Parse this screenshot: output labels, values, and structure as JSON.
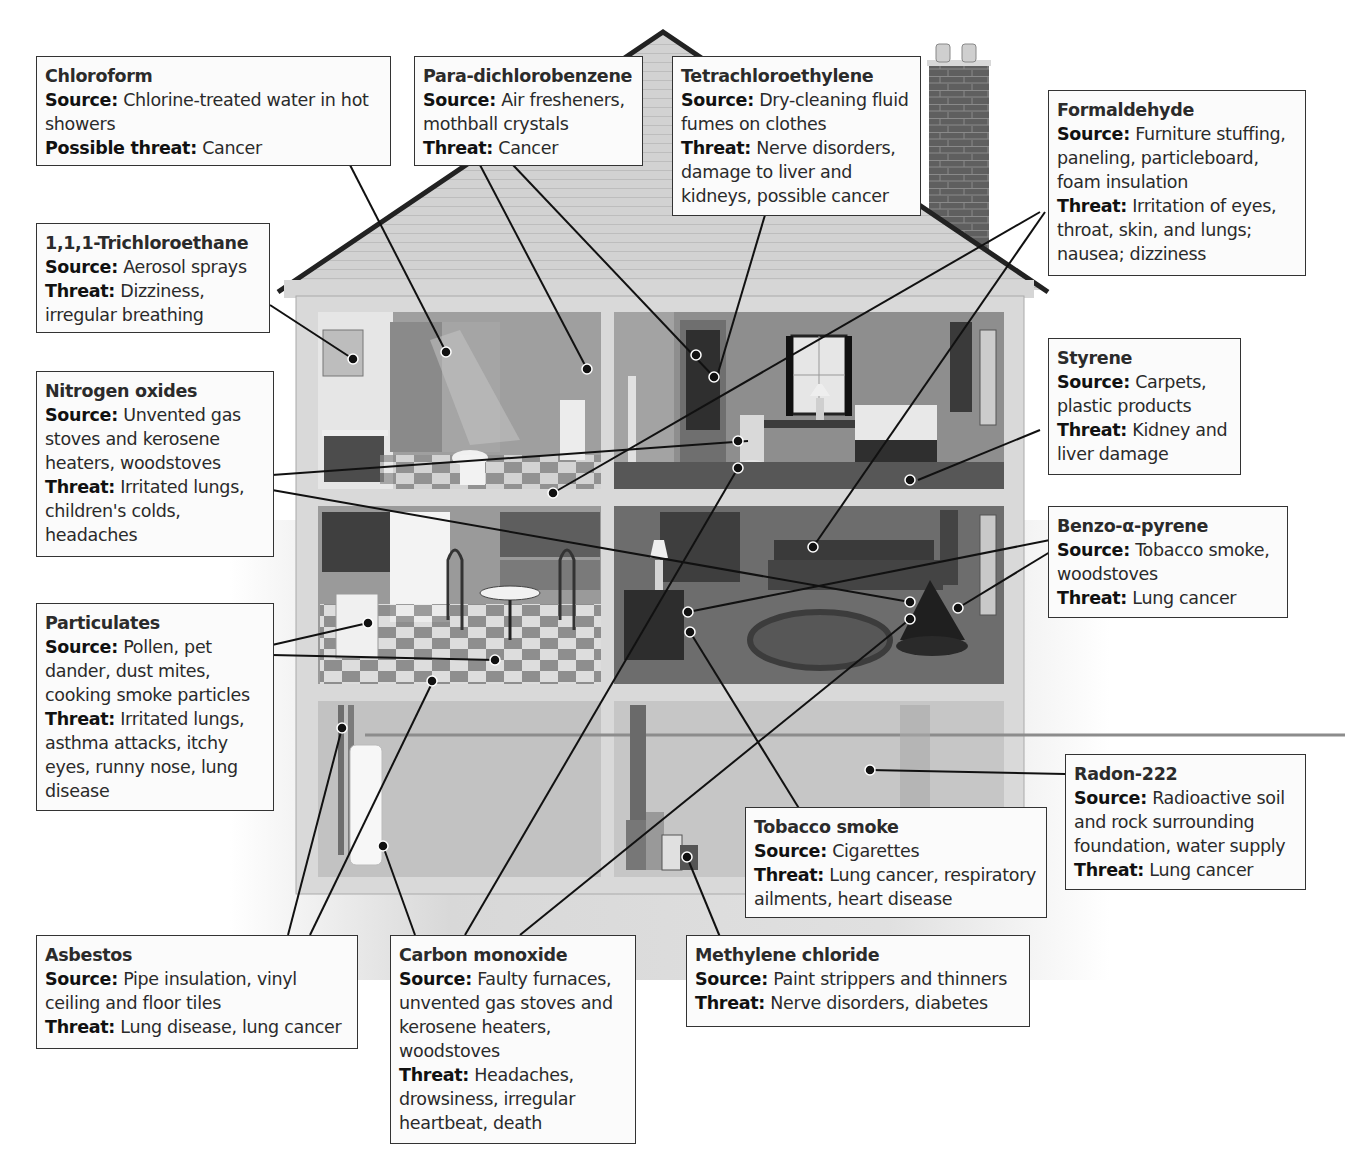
{
  "diagram": {
    "colors": {
      "background": "#ffffff",
      "callout_fill": "#fbfbfb",
      "callout_border": "#333333",
      "leader_line": "#111111",
      "roof": "#cfcfcf",
      "wall": "#d9d9d9",
      "chimney": "#6a6a6a"
    },
    "labels": {
      "source": "Source:",
      "threat": "Threat:",
      "possible_threat": "Possible threat:"
    },
    "pollutants": [
      {
        "id": "chloroform",
        "name": "Chloroform",
        "source_label": "Source:",
        "source": "Chlorine-treated water in hot showers",
        "threat_label": "Possible threat:",
        "threat": "Cancer"
      },
      {
        "id": "para-dichlorobenzene",
        "name": "Para-dichlorobenzene",
        "source_label": "Source:",
        "source": "Air fresheners, mothball crystals",
        "threat_label": "Threat:",
        "threat": "Cancer"
      },
      {
        "id": "tetrachloroethylene",
        "name": "Tetrachloroethylene",
        "source_label": "Source:",
        "source": "Dry-cleaning fluid fumes on clothes",
        "threat_label": "Threat:",
        "threat": "Nerve disorders, damage to liver and kidneys, possible cancer"
      },
      {
        "id": "formaldehyde",
        "name": "Formaldehyde",
        "source_label": "Source:",
        "source": "Furniture stuffing, paneling, particleboard, foam insulation",
        "threat_label": "Threat:",
        "threat": "Irritation of eyes, throat, skin, and lungs; nausea; dizziness"
      },
      {
        "id": "trichloroethane",
        "name": "1,1,1-Trichloroethane",
        "source_label": "Source:",
        "source": "Aerosol sprays",
        "threat_label": "Threat:",
        "threat": "Dizziness, irregular breathing"
      },
      {
        "id": "nitrogen-oxides",
        "name": "Nitrogen oxides",
        "source_label": "Source:",
        "source": "Unvented gas stoves and kerosene heaters, woodstoves",
        "threat_label": "Threat:",
        "threat": "Irritated lungs, children's colds, headaches"
      },
      {
        "id": "styrene",
        "name": "Styrene",
        "source_label": "Source:",
        "source": "Carpets, plastic products",
        "threat_label": "Threat:",
        "threat": "Kidney and liver damage"
      },
      {
        "id": "benzo-a-pyrene",
        "name": "Benzo-α-pyrene",
        "source_label": "Source:",
        "source": "Tobacco smoke, woodstoves",
        "threat_label": "Threat:",
        "threat": "Lung cancer"
      },
      {
        "id": "particulates",
        "name": "Particulates",
        "source_label": "Source:",
        "source": "Pollen, pet dander, dust mites, cooking smoke particles",
        "threat_label": "Threat:",
        "threat": "Irritated lungs, asthma attacks, itchy eyes, runny nose, lung disease"
      },
      {
        "id": "radon-222",
        "name": "Radon-222",
        "source_label": "Source:",
        "source": "Radioactive soil and rock surrounding foundation, water supply",
        "threat_label": "Threat:",
        "threat": "Lung cancer"
      },
      {
        "id": "tobacco-smoke",
        "name": "Tobacco smoke",
        "source_label": "Source:",
        "source": "Cigarettes",
        "threat_label": "Threat:",
        "threat": "Lung cancer, respiratory ailments, heart disease"
      },
      {
        "id": "asbestos",
        "name": "Asbestos",
        "source_label": "Source:",
        "source": "Pipe insulation, vinyl ceiling and floor tiles",
        "threat_label": "Threat:",
        "threat": "Lung disease, lung cancer"
      },
      {
        "id": "carbon-monoxide",
        "name": "Carbon monoxide",
        "source_label": "Source:",
        "source": "Faulty furnaces, unvented gas stoves and kerosene heaters, woodstoves",
        "threat_label": "Threat:",
        "threat": "Headaches, drowsiness, irregular heartbeat, death"
      },
      {
        "id": "methylene-chloride",
        "name": "Methylene chloride",
        "source_label": "Source:",
        "source": "Paint strippers and thinners",
        "threat_label": "Threat:",
        "threat": "Nerve disorders, diabetes"
      }
    ],
    "rooms": [
      "bathroom",
      "bedroom",
      "kitchen",
      "living-room",
      "basement-utility",
      "basement-storage"
    ]
  }
}
